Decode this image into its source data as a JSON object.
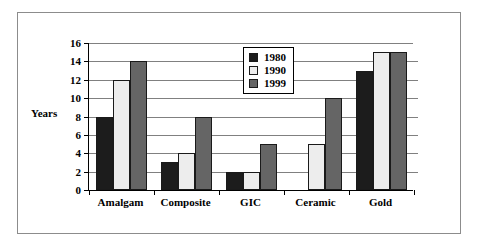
{
  "chart_data": {
    "type": "bar",
    "title": "",
    "xlabel": "",
    "ylabel": "Years",
    "ylim": [
      0,
      16
    ],
    "yticks": [
      0,
      2,
      4,
      6,
      8,
      10,
      12,
      14,
      16
    ],
    "ytick_labels": [
      "0",
      "2",
      "4",
      "6",
      "8",
      "10",
      "12",
      "14",
      "16"
    ],
    "grid": true,
    "legend_position": "upper-center",
    "categories": [
      "Amalgam",
      "Composite",
      "GIC",
      "Ceramic",
      "Gold"
    ],
    "series": [
      {
        "name": "1980",
        "color": "#1c1c1c",
        "values": [
          8,
          3,
          2,
          0,
          13
        ]
      },
      {
        "name": "1990",
        "color": "#ededed",
        "values": [
          12,
          4,
          2,
          5,
          15
        ]
      },
      {
        "name": "1999",
        "color": "#656565",
        "values": [
          14,
          8,
          5,
          10,
          15
        ]
      }
    ]
  },
  "legend": {
    "entries": [
      {
        "label": "1980"
      },
      {
        "label": "1990"
      },
      {
        "label": "1999"
      }
    ]
  },
  "colors": {
    "series_1980": "#1c1c1c",
    "series_1990": "#ededed",
    "series_1999": "#656565",
    "gridline": "#808080",
    "axis": "#000000",
    "frame": "#8c8c8c",
    "background": "#ffffff"
  }
}
